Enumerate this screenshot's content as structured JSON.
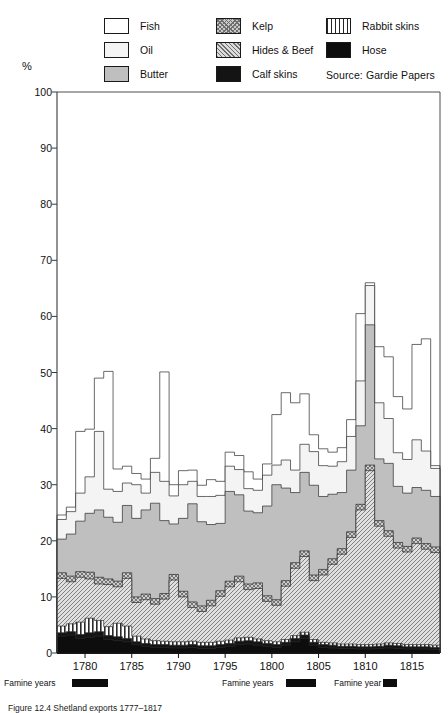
{
  "pct_label": "%",
  "legend": {
    "columns": [
      {
        "items": [
          {
            "label": "Fish",
            "key": "fish",
            "swatch": "p-fish"
          },
          {
            "label": "Oil",
            "key": "oil",
            "swatch": "p-oil"
          },
          {
            "label": "Butter",
            "key": "butter",
            "swatch": "p-butter"
          }
        ]
      },
      {
        "items": [
          {
            "label": "Kelp",
            "key": "kelp",
            "swatch": "p-kelp"
          },
          {
            "label": "Hides & Beef",
            "key": "hides",
            "swatch": "p-hides"
          },
          {
            "label": "Calf skins",
            "key": "calf",
            "swatch": "p-calf"
          }
        ]
      },
      {
        "items": [
          {
            "label": "Rabbit skins",
            "key": "rabbit",
            "swatch": "p-rabbit"
          },
          {
            "label": "Hose",
            "key": "hose",
            "swatch": "p-hose"
          }
        ]
      }
    ],
    "source": "Source: Gardie  Papers"
  },
  "famine_markers": [
    {
      "label": "Famine years",
      "x": 4,
      "bar_x": 78,
      "bar_w": 36
    },
    {
      "label": "Famine years",
      "x": 222,
      "bar_x": 292,
      "bar_w": 30
    },
    {
      "label": "Famine year",
      "x": 334,
      "bar_x": 394,
      "bar_w": 14
    }
  ],
  "caption": "Figure 12.4 Shetland exports 1777–1817",
  "chart_data": {
    "type": "area",
    "xlabel": "",
    "ylabel": "%",
    "ylim": [
      0,
      100
    ],
    "yticks": [
      0,
      10,
      20,
      30,
      40,
      50,
      60,
      70,
      80,
      90,
      100
    ],
    "xlim": [
      1777,
      1817
    ],
    "xticks": [
      1780,
      1785,
      1790,
      1795,
      1800,
      1805,
      1810,
      1815
    ],
    "grid": false,
    "legend_position": "top",
    "stacked": true,
    "stack_order": [
      "hose",
      "calf",
      "rabbit",
      "hides",
      "kelp",
      "butter",
      "oil",
      "fish"
    ],
    "x": [
      1777,
      1778,
      1779,
      1780,
      1781,
      1782,
      1783,
      1784,
      1785,
      1786,
      1787,
      1788,
      1789,
      1790,
      1791,
      1792,
      1793,
      1794,
      1795,
      1796,
      1797,
      1798,
      1799,
      1800,
      1801,
      1802,
      1803,
      1804,
      1805,
      1806,
      1807,
      1808,
      1809,
      1810,
      1811,
      1812,
      1813,
      1814,
      1815,
      1816,
      1817
    ],
    "series": [
      {
        "name": "Hose",
        "key": "hose",
        "pattern": "solid-black",
        "values": [
          3.0,
          3.2,
          2.6,
          2.8,
          3.0,
          2.4,
          2.2,
          2.0,
          1.5,
          1.2,
          1.0,
          1.0,
          0.9,
          0.9,
          1.0,
          0.8,
          0.8,
          1.0,
          1.2,
          1.5,
          1.6,
          1.4,
          1.2,
          1.0,
          1.4,
          2.0,
          2.6,
          1.4,
          1.0,
          0.9,
          0.8,
          0.8,
          0.7,
          0.7,
          0.8,
          0.9,
          0.8,
          0.7,
          0.7,
          0.7,
          0.6
        ]
      },
      {
        "name": "Calf skins",
        "key": "calf",
        "pattern": "solid-black",
        "values": [
          0.6,
          0.6,
          0.7,
          0.8,
          0.8,
          0.7,
          0.7,
          0.6,
          0.5,
          0.5,
          0.5,
          0.5,
          0.5,
          0.5,
          0.5,
          0.5,
          0.5,
          0.5,
          0.5,
          0.6,
          0.6,
          0.6,
          0.5,
          0.5,
          0.5,
          0.6,
          0.6,
          0.5,
          0.5,
          0.5,
          0.4,
          0.4,
          0.4,
          0.4,
          0.4,
          0.5,
          0.5,
          0.4,
          0.4,
          0.4,
          0.4
        ]
      },
      {
        "name": "Rabbit skins",
        "key": "rabbit",
        "pattern": "vertical-stripes",
        "values": [
          1.2,
          1.4,
          2.2,
          2.6,
          2.0,
          1.6,
          2.4,
          2.2,
          1.0,
          0.8,
          0.7,
          0.6,
          0.6,
          0.6,
          0.6,
          0.6,
          0.6,
          0.6,
          0.6,
          0.6,
          0.6,
          0.5,
          0.5,
          0.5,
          0.5,
          0.5,
          0.5,
          0.5,
          0.4,
          0.4,
          0.4,
          0.4,
          0.4,
          0.4,
          0.4,
          0.4,
          0.4,
          0.4,
          0.4,
          0.4,
          0.4
        ]
      },
      {
        "name": "Hides & Beef",
        "key": "hides",
        "pattern": "diagonal-hatch",
        "values": [
          8.5,
          7.5,
          8.0,
          7.0,
          6.5,
          7.5,
          6.5,
          8.5,
          6.0,
          7.0,
          6.5,
          7.5,
          11.0,
          8.0,
          6.0,
          5.5,
          6.5,
          8.0,
          9.5,
          10.0,
          8.5,
          9.0,
          7.0,
          6.5,
          9.5,
          12.0,
          13.5,
          10.5,
          12.0,
          14.0,
          16.0,
          19.0,
          24.0,
          31.0,
          21.0,
          19.0,
          17.0,
          16.5,
          18.0,
          17.0,
          16.5
        ]
      },
      {
        "name": "Kelp",
        "key": "kelp",
        "pattern": "cross-hatch",
        "values": [
          1.0,
          1.0,
          1.0,
          1.2,
          1.2,
          1.0,
          1.0,
          1.0,
          1.0,
          1.0,
          1.0,
          1.0,
          1.0,
          1.0,
          1.0,
          1.0,
          1.0,
          1.0,
          1.0,
          1.0,
          1.0,
          1.0,
          1.0,
          1.0,
          1.0,
          1.0,
          1.0,
          1.0,
          1.0,
          1.0,
          1.0,
          1.0,
          1.0,
          1.0,
          1.0,
          1.0,
          1.0,
          1.0,
          1.0,
          1.0,
          1.0
        ]
      },
      {
        "name": "Butter",
        "key": "butter",
        "pattern": "solid-grey",
        "values": [
          6.0,
          7.5,
          9.0,
          10.5,
          12.0,
          11.0,
          10.5,
          12.0,
          14.0,
          15.0,
          17.0,
          13.0,
          9.0,
          13.0,
          17.5,
          15.0,
          13.5,
          12.0,
          16.0,
          14.5,
          13.0,
          12.5,
          16.0,
          20.5,
          16.5,
          12.5,
          14.0,
          16.0,
          13.0,
          11.5,
          10.0,
          11.0,
          14.0,
          25.0,
          11.0,
          12.0,
          10.0,
          9.5,
          9.0,
          9.5,
          9.0
        ]
      },
      {
        "name": "Oil",
        "key": "oil",
        "pattern": "light-grey",
        "values": [
          3.5,
          4.0,
          5.0,
          6.5,
          14.0,
          5.0,
          5.5,
          4.0,
          6.0,
          3.0,
          5.5,
          7.0,
          5.0,
          6.0,
          4.0,
          4.5,
          5.0,
          5.0,
          4.5,
          4.5,
          4.0,
          4.0,
          5.5,
          3.5,
          5.0,
          4.0,
          5.0,
          6.0,
          5.5,
          5.0,
          5.5,
          6.0,
          8.0,
          7.0,
          10.0,
          8.0,
          6.0,
          6.0,
          8.5,
          7.0,
          5.0
        ]
      },
      {
        "name": "Fish",
        "key": "fish",
        "pattern": "white",
        "values": [
          0.8,
          0.8,
          11.0,
          8.5,
          9.5,
          21.0,
          4.0,
          3.0,
          2.0,
          2.5,
          2.5,
          19.5,
          2.0,
          2.5,
          2.0,
          2.0,
          3.0,
          2.5,
          2.5,
          2.5,
          3.0,
          2.0,
          2.0,
          9.0,
          12.0,
          12.0,
          9.0,
          3.0,
          3.0,
          2.5,
          2.5,
          3.0,
          12.0,
          0.5,
          10.0,
          11.0,
          10.0,
          9.0,
          17.0,
          20.0,
          0.5
        ]
      }
    ]
  }
}
